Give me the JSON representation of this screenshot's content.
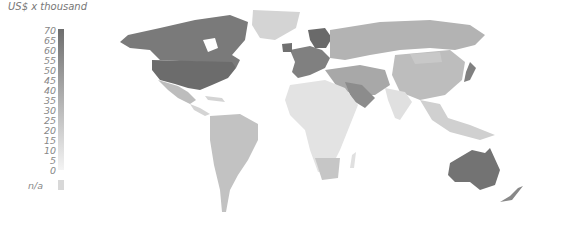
{
  "legend": {
    "title": "US$ x thousand",
    "ticks": [
      "70",
      "65",
      "60",
      "55",
      "50",
      "45",
      "40",
      "35",
      "30",
      "25",
      "20",
      "15",
      "10",
      "5",
      "0"
    ],
    "na_label": "n/a",
    "color_high": "#6e6e6e",
    "color_low": "#f4f4f4",
    "na_color": "#d8d8d8"
  },
  "map": {
    "regions": [
      {
        "name": "Canada",
        "shade": "#7a7a7a"
      },
      {
        "name": "United States",
        "shade": "#6c6c6c"
      },
      {
        "name": "Greenland",
        "shade": "#d4d4d4"
      },
      {
        "name": "Mexico",
        "shade": "#bdbdbd"
      },
      {
        "name": "Central America",
        "shade": "#d4d4d4"
      },
      {
        "name": "South America",
        "shade": "#c2c2c2"
      },
      {
        "name": "Western Europe",
        "shade": "#808080"
      },
      {
        "name": "Scandinavia",
        "shade": "#6a6a6a"
      },
      {
        "name": "Russia",
        "shade": "#b3b3b3"
      },
      {
        "name": "Middle East",
        "shade": "#a8a8a8"
      },
      {
        "name": "Saudi Arabia",
        "shade": "#8c8c8c"
      },
      {
        "name": "Africa",
        "shade": "#e3e3e3"
      },
      {
        "name": "South Africa",
        "shade": "#c6c6c6"
      },
      {
        "name": "China",
        "shade": "#bdbdbd"
      },
      {
        "name": "India",
        "shade": "#e0e0e0"
      },
      {
        "name": "Japan",
        "shade": "#808080"
      },
      {
        "name": "Southeast Asia",
        "shade": "#d0d0d0"
      },
      {
        "name": "Australia",
        "shade": "#737373"
      },
      {
        "name": "New Zealand",
        "shade": "#888888"
      }
    ]
  }
}
